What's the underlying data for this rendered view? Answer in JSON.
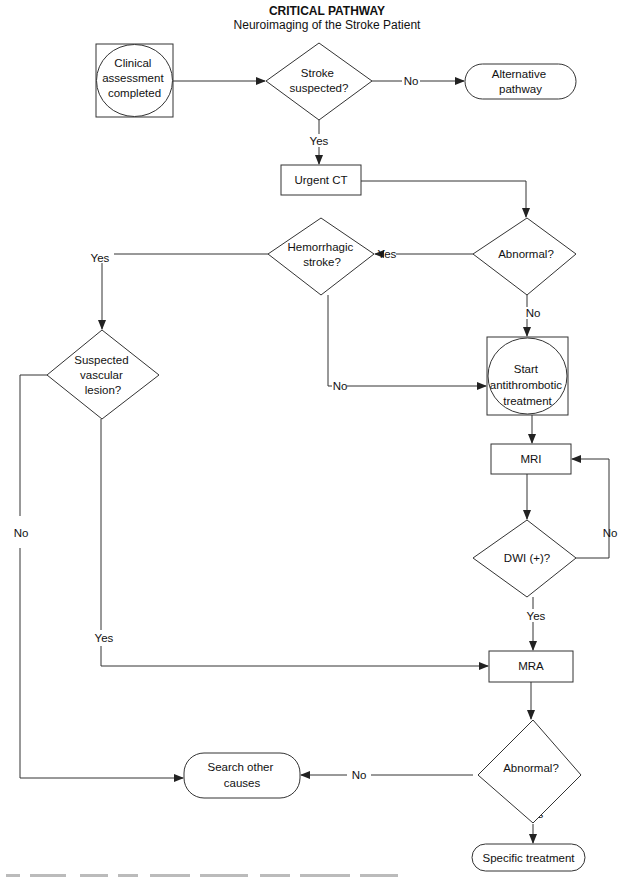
{
  "header": {
    "title": "CRITICAL PATHWAY",
    "subtitle": "Neuroimaging of the Stroke Patient"
  },
  "nodes": {
    "clinical": {
      "lines": [
        "Clinical",
        "assessment",
        "completed"
      ],
      "shape": "circle-in-square"
    },
    "stroke_suspected": {
      "lines": [
        "Stroke",
        "suspected?"
      ],
      "shape": "diamond"
    },
    "alternative": {
      "lines": [
        "Alternative",
        "pathway"
      ],
      "shape": "terminal"
    },
    "urgent_ct": {
      "lines": [
        "Urgent CT"
      ],
      "shape": "process"
    },
    "abnormal1": {
      "lines": [
        "Abnormal?"
      ],
      "shape": "diamond"
    },
    "hemorrhagic": {
      "lines": [
        "Hemorrhagic",
        "stroke?"
      ],
      "shape": "diamond"
    },
    "vascular": {
      "lines": [
        "Suspected",
        "vascular",
        "lesion?"
      ],
      "shape": "diamond"
    },
    "antithrombotic": {
      "lines": [
        "Start",
        "antithrombotic",
        "treatment"
      ],
      "shape": "circle-in-square"
    },
    "mri": {
      "lines": [
        "MRI"
      ],
      "shape": "process"
    },
    "dwi": {
      "lines": [
        "DWI (+)?"
      ],
      "shape": "diamond"
    },
    "mra": {
      "lines": [
        "MRA"
      ],
      "shape": "process"
    },
    "abnormal2": {
      "lines": [
        "Abnormal?"
      ],
      "shape": "diamond"
    },
    "search": {
      "lines": [
        "Search other",
        "causes"
      ],
      "shape": "terminal"
    },
    "specific": {
      "lines": [
        "Specific treatment"
      ],
      "shape": "terminal"
    }
  },
  "edge_labels": {
    "stroke_no": "No",
    "stroke_yes": "Yes",
    "abn1_yes": "Yes",
    "abn1_no": "No",
    "hem_yes": "Yes",
    "hem_no": "No",
    "vasc_no": "No",
    "vasc_yes": "Yes",
    "dwi_no": "No",
    "dwi_yes": "Yes",
    "abn2_no": "No",
    "abn2_yes": "Yes"
  },
  "edges": [
    {
      "from": "clinical",
      "to": "stroke_suspected",
      "label": ""
    },
    {
      "from": "stroke_suspected",
      "to": "alternative",
      "label": "No"
    },
    {
      "from": "stroke_suspected",
      "to": "urgent_ct",
      "label": "Yes"
    },
    {
      "from": "urgent_ct",
      "to": "abnormal1",
      "label": ""
    },
    {
      "from": "abnormal1",
      "to": "hemorrhagic",
      "label": "Yes"
    },
    {
      "from": "abnormal1",
      "to": "antithrombotic",
      "label": "No"
    },
    {
      "from": "hemorrhagic",
      "to": "vascular",
      "label": "Yes"
    },
    {
      "from": "hemorrhagic",
      "to": "antithrombotic",
      "label": "No"
    },
    {
      "from": "antithrombotic",
      "to": "mri",
      "label": ""
    },
    {
      "from": "mri",
      "to": "dwi",
      "label": ""
    },
    {
      "from": "dwi",
      "to": "mri",
      "label": "No"
    },
    {
      "from": "dwi",
      "to": "mra",
      "label": "Yes"
    },
    {
      "from": "vascular",
      "to": "mra",
      "label": "Yes"
    },
    {
      "from": "vascular",
      "to": "search",
      "label": "No"
    },
    {
      "from": "mra",
      "to": "abnormal2",
      "label": ""
    },
    {
      "from": "abnormal2",
      "to": "search",
      "label": "No"
    },
    {
      "from": "abnormal2",
      "to": "specific",
      "label": "Yes"
    }
  ]
}
